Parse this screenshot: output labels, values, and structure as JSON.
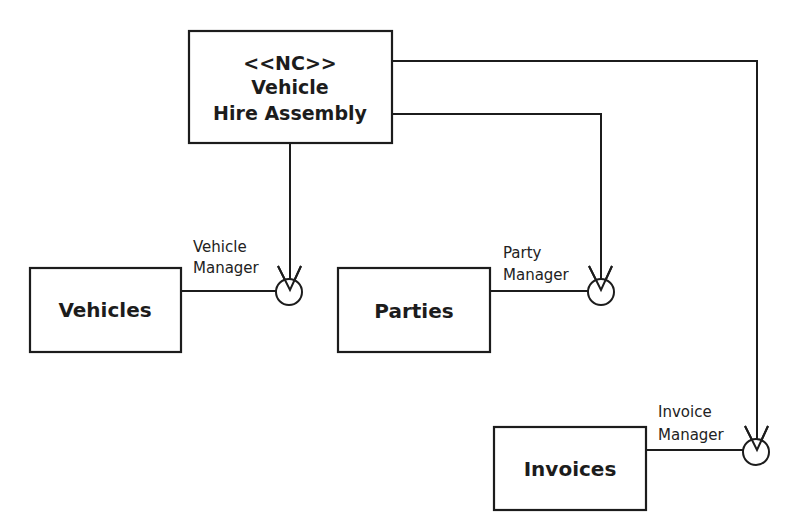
{
  "diagram": {
    "type": "UML component diagram",
    "assembly": {
      "stereotype": "<<NC>>",
      "name_line1": "Vehicle",
      "name_line2": "Hire Assembly"
    },
    "components": [
      {
        "name": "Vehicles",
        "interface_line1": "Vehicle",
        "interface_line2": "Manager"
      },
      {
        "name": "Parties",
        "interface_line1": "Party",
        "interface_line2": "Manager"
      },
      {
        "name": "Invoices",
        "interface_line1": "Invoice",
        "interface_line2": "Manager"
      }
    ],
    "colors": {
      "stroke": "#1c1c1c",
      "background": "#ffffff"
    }
  }
}
